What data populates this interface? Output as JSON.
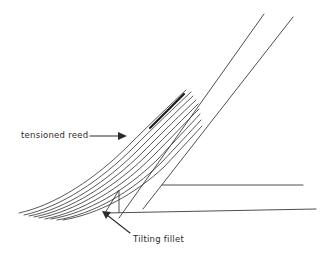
{
  "figure": {
    "type": "technical-line-drawing",
    "background_color": "#ffffff",
    "line_color": "#3a3a3a",
    "text_color": "#2b2b2b"
  },
  "annotations": {
    "tensioned_reed": {
      "label": "tensioned reed",
      "arrow": "arrow-right",
      "arrow_from": [
        90,
        136
      ],
      "arrow_to": [
        126,
        136
      ]
    },
    "tilting_fillet": {
      "label": "Tilting fillet",
      "arrow": "arrow-up-left",
      "arrow_from": [
        130,
        233
      ],
      "arrow_to": [
        103,
        212
      ]
    }
  },
  "geometry": {
    "rafter_upper": {
      "from": [
        119,
        218
      ],
      "to": [
        264,
        14
      ]
    },
    "rafter_lower": {
      "from": [
        143,
        209
      ],
      "to": [
        293,
        17
      ]
    },
    "fascia_line": {
      "from": [
        162,
        185
      ],
      "to": [
        303,
        185
      ]
    },
    "eaves_line": {
      "from": [
        105,
        213
      ],
      "to": [
        316,
        209
      ]
    },
    "fillet_apex": [
      119,
      190
    ],
    "fillet_base_left": [
      105,
      213
    ],
    "fillet_base_right": [
      119,
      213
    ],
    "reed_count": 9,
    "reed_highlight_index": 8
  }
}
